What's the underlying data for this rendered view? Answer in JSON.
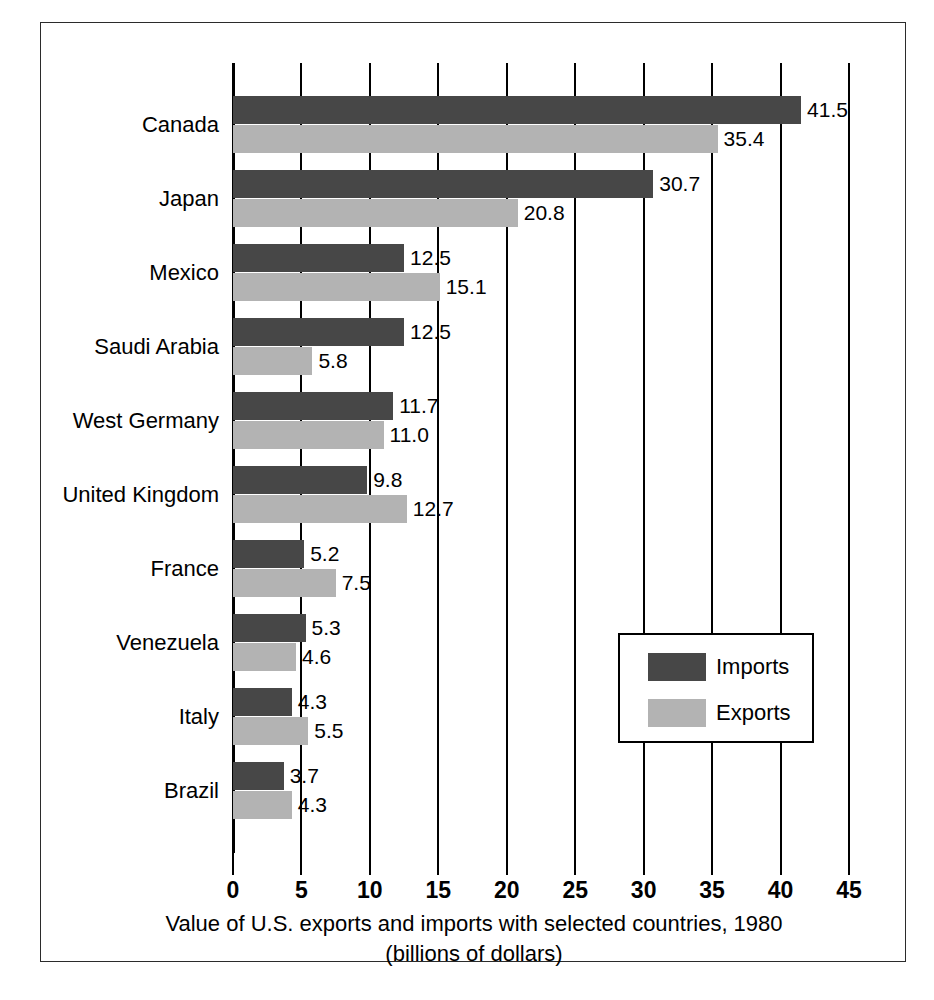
{
  "chart_data": {
    "type": "bar",
    "orientation": "horizontal",
    "title": "",
    "caption_line1": "Value of U.S. exports and imports with selected countries, 1980",
    "caption_line2": "(billions of dollars)",
    "xlabel": "",
    "ylabel": "",
    "xlim": [
      0,
      45
    ],
    "xticks": [
      0,
      5,
      10,
      15,
      20,
      25,
      30,
      35,
      40,
      45
    ],
    "xtick_labels": [
      "0",
      "5",
      "10",
      "15",
      "20",
      "25",
      "30",
      "35",
      "40",
      "45"
    ],
    "grid": true,
    "legend_position": "inside-lower-right",
    "categories": [
      "Canada",
      "Japan",
      "Mexico",
      "Saudi Arabia",
      "West Germany",
      "United Kingdom",
      "France",
      "Venezuela",
      "Italy",
      "Brazil"
    ],
    "series": [
      {
        "name": "Imports",
        "color": "#474747",
        "values": [
          41.5,
          30.7,
          12.5,
          12.5,
          11.7,
          9.8,
          5.2,
          5.3,
          4.3,
          3.7
        ],
        "labels": [
          "41.5",
          "30.7",
          "12.5",
          "12.5",
          "11.7",
          "9.8",
          "5.2",
          "5.3",
          "4.3",
          "3.7"
        ]
      },
      {
        "name": "Exports",
        "color": "#b3b3b3",
        "values": [
          35.4,
          20.8,
          15.1,
          5.8,
          11.0,
          12.7,
          7.5,
          4.6,
          5.5,
          4.3
        ],
        "labels": [
          "35.4",
          "20.8",
          "15.1",
          "5.8",
          "11.0",
          "12.7",
          "7.5",
          "4.6",
          "5.5",
          "4.3"
        ]
      }
    ]
  },
  "legend": {
    "entries": [
      {
        "label": "Imports",
        "color": "#474747"
      },
      {
        "label": "Exports",
        "color": "#b3b3b3"
      }
    ]
  }
}
